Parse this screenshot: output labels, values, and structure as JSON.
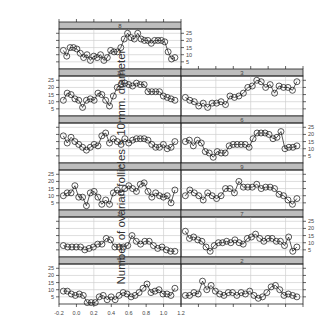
{
  "chart_data": {
    "type": "scatter",
    "subtype": "trellis-line-with-points",
    "title": "",
    "xlabel": "",
    "ylabel": "Number of ovarian follicles > 10 mm. diameter",
    "xlim": [
      -0.2,
      1.2
    ],
    "ylim": [
      0,
      28
    ],
    "x_ticks": [
      "-0.2",
      "0.0",
      "0.2",
      "0.4",
      "0.6",
      "0.8",
      "1.0",
      "1.2"
    ],
    "y_ticks": [
      "5",
      "10",
      "15",
      "20",
      "25"
    ],
    "grid": true,
    "layout": {
      "columns": 2,
      "rows": 6
    },
    "panels": [
      {
        "label": "8",
        "row": 0,
        "col": 0,
        "x": [
          -0.15,
          -0.12,
          -0.09,
          -0.05,
          -0.01,
          0.02,
          0.05,
          0.09,
          0.12,
          0.15,
          0.19,
          0.22,
          0.26,
          0.29,
          0.33,
          0.37,
          0.4,
          0.43,
          0.47,
          0.5,
          0.53,
          0.57,
          0.61,
          0.64,
          0.68,
          0.71,
          0.75,
          0.79,
          0.83,
          0.87,
          0.91,
          0.94,
          0.98,
          1.02,
          1.05,
          1.09,
          1.13
        ],
        "values": [
          13,
          9,
          15,
          15,
          14,
          11,
          8,
          10,
          6,
          9,
          8,
          10,
          6,
          8,
          13,
          12,
          12,
          15,
          21,
          25,
          22,
          21,
          25,
          21,
          20,
          20,
          18,
          20,
          20,
          20,
          19,
          12,
          7,
          8
        ]
      },
      {
        "label": "10",
        "row": 1,
        "col": 0,
        "values": [
          11,
          16,
          15,
          12,
          11,
          6,
          11,
          12,
          11,
          16,
          15,
          11,
          7,
          14,
          20,
          22,
          23,
          22,
          21,
          23,
          22,
          22,
          17,
          17,
          17,
          17,
          14,
          13,
          12,
          11
        ]
      },
      {
        "label": "3",
        "row": 1,
        "col": 1,
        "values": [
          13,
          11,
          10,
          7,
          9,
          6,
          9,
          9,
          10,
          8,
          14,
          13,
          14,
          16,
          20,
          21,
          25,
          24,
          20,
          22,
          16,
          21,
          20,
          20,
          18,
          24
        ]
      },
      {
        "label": "1",
        "row": 2,
        "col": 0,
        "values": [
          19,
          14,
          18,
          15,
          13,
          11,
          9,
          11,
          13,
          12,
          19,
          21,
          14,
          17,
          15,
          13,
          17,
          14,
          16,
          17,
          17,
          17,
          16,
          13,
          11,
          11,
          13,
          10,
          11,
          15
        ]
      },
      {
        "label": "6",
        "row": 2,
        "col": 1,
        "values": [
          15,
          16,
          12,
          16,
          14,
          8,
          7,
          4,
          8,
          7,
          7,
          12,
          13,
          13,
          13,
          13,
          11,
          17,
          21,
          21,
          21,
          20,
          17,
          18,
          22,
          10,
          11,
          11,
          12
        ]
      },
      {
        "label": "5",
        "row": 3,
        "col": 0,
        "values": [
          10,
          12,
          12,
          17,
          9,
          9,
          3,
          12,
          13,
          9,
          4,
          7,
          4,
          12,
          14,
          12,
          15,
          17,
          15,
          13,
          18,
          19,
          13,
          9,
          12,
          10,
          9,
          10,
          5,
          14
        ]
      },
      {
        "label": "9",
        "row": 3,
        "col": 1,
        "values": [
          10,
          14,
          12,
          10,
          7,
          12,
          10,
          8,
          10,
          15,
          15,
          12,
          20,
          16,
          16,
          16,
          18,
          15,
          16,
          16,
          15,
          11,
          10,
          7,
          4,
          8
        ]
      },
      {
        "label": "11",
        "row": 4,
        "col": 0,
        "values": [
          8,
          7,
          7,
          7,
          7,
          5,
          6,
          7,
          9,
          9,
          13,
          12,
          7,
          7,
          7,
          8,
          15,
          11,
          9,
          11,
          11,
          8,
          6,
          7,
          5,
          4,
          4
        ]
      },
      {
        "label": "7",
        "row": 4,
        "col": 1,
        "values": [
          18,
          13,
          14,
          12,
          11,
          7,
          4,
          8,
          10,
          10,
          11,
          10,
          12,
          10,
          9,
          13,
          14,
          16,
          13,
          11,
          13,
          13,
          11,
          11,
          8,
          14,
          4,
          7
        ]
      },
      {
        "label": "4",
        "row": 5,
        "col": 0,
        "values": [
          9,
          9,
          7,
          6,
          7,
          6,
          1,
          1,
          1,
          5,
          6,
          3,
          5,
          3,
          6,
          8,
          7,
          5,
          6,
          8,
          11,
          14,
          8,
          9,
          10,
          7,
          7,
          6,
          11
        ]
      },
      {
        "label": "2",
        "row": 5,
        "col": 1,
        "values": [
          6,
          6,
          8,
          7,
          16,
          10,
          13,
          9,
          7,
          6,
          8,
          8,
          6,
          8,
          7,
          9,
          6,
          4,
          5,
          8,
          12,
          13,
          10,
          6,
          7,
          6,
          5
        ]
      }
    ]
  },
  "colors": {
    "strip": "#bdbdbd",
    "grid": "#cfcfcf",
    "frame": "#222222",
    "line": "#111111",
    "point": "#111111"
  }
}
